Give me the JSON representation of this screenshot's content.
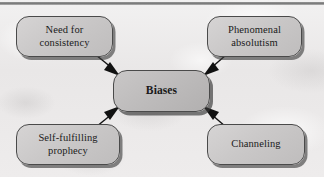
{
  "figure": {
    "type": "concept-map",
    "center_label": "Biases",
    "background": "#eceaea",
    "node_fill": "#cac8c8",
    "node_border": "#4a4a4a",
    "text_color": "#1a1a1a",
    "arrow_color": "#111111"
  },
  "nodes": {
    "center": {
      "label": "Biases",
      "position": "center"
    },
    "top_left": {
      "label": "Need for\nconsistency",
      "position": "top-left"
    },
    "top_right": {
      "label": "Phenomenal\nabsolutism",
      "position": "top-right"
    },
    "bottom_left": {
      "label": "Self-fulfilling\nprophecy",
      "position": "bottom-left"
    },
    "bottom_right": {
      "label": "Channeling",
      "position": "bottom-right"
    }
  },
  "connections": [
    {
      "from": "Need for consistency",
      "to": "Biases",
      "direction": "down-right"
    },
    {
      "from": "Phenomenal absolutism",
      "to": "Biases",
      "direction": "down-left"
    },
    {
      "from": "Self-fulfilling prophecy",
      "to": "Biases",
      "direction": "up-right"
    },
    {
      "from": "Channeling",
      "to": "Biases",
      "direction": "up-left"
    }
  ]
}
